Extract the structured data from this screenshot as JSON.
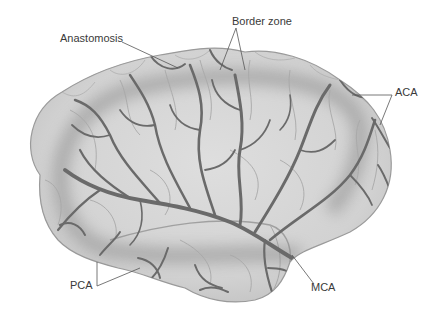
{
  "diagram": {
    "labels": {
      "anastomosis": "Anastomosis",
      "border_zone": "Border zone",
      "aca": "ACA",
      "mca": "MCA",
      "pca": "PCA"
    },
    "colors": {
      "brain_surface": "#d6d6d6",
      "brain_outline": "#9a9a9a",
      "vessel": "#6a6a6a",
      "border_zone_shade": "#9e9e9e",
      "sulci": "#a8a8a8",
      "leader_line": "#555555",
      "label_text": "#3a3a3a",
      "background": "#ffffff"
    }
  }
}
